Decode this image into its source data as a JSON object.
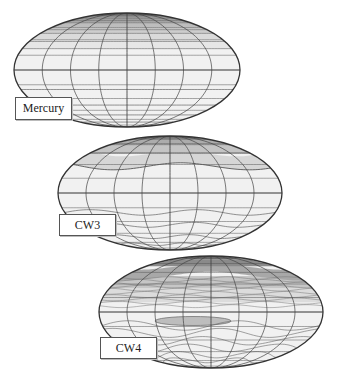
{
  "figure": {
    "panels": [
      {
        "label": "Mercury",
        "cx": 127,
        "cy": 70,
        "rx": 113,
        "ry": 57,
        "label_box": {
          "x": 15,
          "y": 97,
          "w": 57,
          "h": 23
        },
        "style": "mercury"
      },
      {
        "label": "CW3",
        "cx": 170,
        "cy": 193,
        "rx": 112,
        "ry": 57,
        "label_box": {
          "x": 59,
          "y": 214,
          "w": 57,
          "h": 22
        },
        "style": "cw3"
      },
      {
        "label": "CW4",
        "cx": 211,
        "cy": 312,
        "rx": 112,
        "ry": 56,
        "label_box": {
          "x": 100,
          "y": 337,
          "w": 57,
          "h": 22
        },
        "style": "cw4"
      }
    ]
  },
  "colors": {
    "outline": "#333333",
    "grid": "#555555",
    "pale": "#f1f1f1",
    "light": "#e2e2e2",
    "mid": "#c8c8c8",
    "dark": "#9a9a9a",
    "darkest": "#6e6e6e"
  }
}
